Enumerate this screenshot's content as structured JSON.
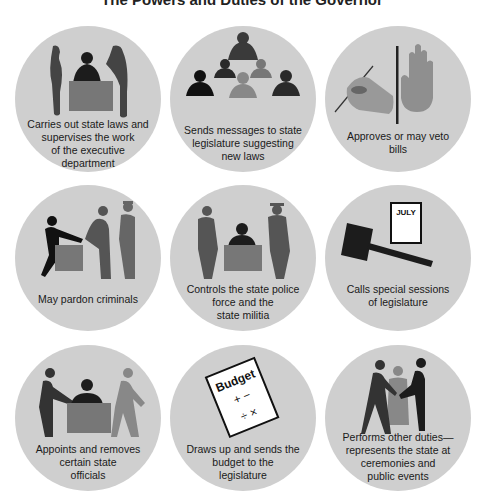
{
  "title": "The Powers and Duties of the Governor",
  "colors": {
    "background": "#ffffff",
    "circle": "#cfcfcf",
    "dark": "#1c1c1c",
    "mid": "#555555",
    "light": "#8a8a8a",
    "desk": "#7a7a7a"
  },
  "duties": [
    {
      "id": "executive",
      "caption": "Carries out state laws and\nsupervises the work\nof the executive\ndepartment",
      "icon": "governor-at-desk-with-aides-icon"
    },
    {
      "id": "messages",
      "caption": "Sends messages to state\nlegislature suggesting\nnew laws",
      "icon": "governor-addressing-legislators-icon"
    },
    {
      "id": "veto",
      "caption": "Approves or may veto\nbills",
      "icon": "signing-hand-and-raised-palm-icon"
    },
    {
      "id": "pardon",
      "caption": "May pardon criminals",
      "icon": "pardon-handshake-icon"
    },
    {
      "id": "police",
      "caption": "Controls the state police\nforce and the\nstate militia",
      "icon": "saluting-officers-icon"
    },
    {
      "id": "sessions",
      "caption": "Calls special sessions\nof legislature",
      "icon": "gavel-and-calendar-icon",
      "calendar_label": "JULY"
    },
    {
      "id": "appoints",
      "caption": "Appoints and removes\ncertain state\nofficials",
      "icon": "appoint-remove-officials-icon"
    },
    {
      "id": "budget",
      "caption": "Draws up and sends the\nbudget to the\nlegislature",
      "icon": "budget-document-icon",
      "doc_label": "Budget",
      "doc_symbols": "+ −\n÷ ×"
    },
    {
      "id": "ceremonies",
      "caption": "Performs other duties—\nrepresents the state at\nceremonies and\npublic events",
      "icon": "ceremonial-handshake-icon"
    }
  ]
}
